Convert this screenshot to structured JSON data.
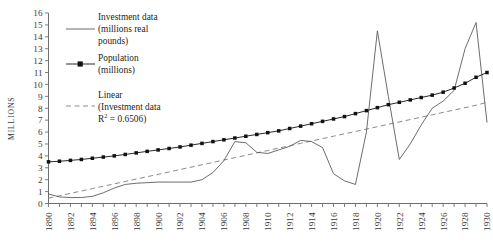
{
  "chart_data": {
    "type": "line",
    "title": "",
    "xlabel": "",
    "ylabel": "MILLIONS",
    "xlim": [
      1890,
      1930
    ],
    "ylim": [
      0,
      16
    ],
    "grid": false,
    "legend_position": "top-left-inside",
    "x_tick_labels": [
      "1890",
      "1892",
      "1894",
      "1896",
      "1898",
      "1900",
      "1902",
      "1904",
      "1906",
      "1908",
      "1910",
      "1912",
      "1914",
      "1916",
      "1918",
      "1920",
      "1922",
      "1924",
      "1926",
      "1928",
      "1930"
    ],
    "y_tick_labels": [
      "0",
      "1",
      "2",
      "3",
      "4",
      "5",
      "6",
      "7",
      "8",
      "9",
      "10",
      "11",
      "12",
      "13",
      "14",
      "15",
      "16"
    ],
    "x": [
      1890,
      1891,
      1892,
      1893,
      1894,
      1895,
      1896,
      1897,
      1898,
      1899,
      1900,
      1901,
      1902,
      1903,
      1904,
      1905,
      1906,
      1907,
      1908,
      1909,
      1910,
      1911,
      1912,
      1913,
      1914,
      1915,
      1916,
      1917,
      1918,
      1919,
      1920,
      1921,
      1922,
      1923,
      1924,
      1925,
      1926,
      1927,
      1928,
      1929,
      1930
    ],
    "series": [
      {
        "name": "Investment data (millions real pounds)",
        "style": "solid",
        "marker": "none",
        "color": "#555555",
        "values": [
          0.8,
          0.55,
          0.5,
          0.5,
          0.6,
          0.9,
          1.3,
          1.6,
          1.7,
          1.75,
          1.8,
          1.8,
          1.8,
          1.8,
          2.0,
          2.6,
          3.6,
          5.2,
          5.1,
          4.3,
          4.2,
          4.5,
          4.8,
          5.3,
          5.2,
          4.7,
          2.5,
          1.9,
          1.6,
          6.0,
          14.5,
          9.0,
          3.7,
          5.0,
          6.6,
          8.0,
          8.6,
          9.5,
          13.0,
          15.2,
          6.8
        ]
      },
      {
        "name": "Population (millions)",
        "style": "solid",
        "marker": "square",
        "color": "#000000",
        "values": [
          3.5,
          3.55,
          3.62,
          3.7,
          3.8,
          3.9,
          4.0,
          4.12,
          4.25,
          4.38,
          4.5,
          4.62,
          4.75,
          4.9,
          5.05,
          5.2,
          5.35,
          5.5,
          5.65,
          5.8,
          5.95,
          6.1,
          6.3,
          6.5,
          6.7,
          6.9,
          7.1,
          7.3,
          7.55,
          7.8,
          8.05,
          8.3,
          8.5,
          8.7,
          8.9,
          9.1,
          9.35,
          9.7,
          10.1,
          10.6,
          11.0
        ]
      },
      {
        "name": "Linear (Investment data)",
        "style": "dashed",
        "marker": "none",
        "color": "#777777",
        "trendline": true,
        "r_squared": 0.6506,
        "values": [
          0.45,
          0.65,
          0.85,
          1.05,
          1.25,
          1.45,
          1.65,
          1.85,
          2.05,
          2.25,
          2.45,
          2.65,
          2.85,
          3.05,
          3.25,
          3.45,
          3.65,
          3.85,
          4.05,
          4.25,
          4.45,
          4.65,
          4.85,
          5.05,
          5.25,
          5.45,
          5.65,
          5.85,
          6.05,
          6.25,
          6.45,
          6.65,
          6.85,
          7.05,
          7.25,
          7.45,
          7.65,
          7.85,
          8.05,
          8.25,
          8.5
        ]
      }
    ]
  },
  "legend": {
    "items": [
      {
        "id": "investment",
        "line1": "Investment data",
        "line2": "(millions real",
        "line3": "pounds)",
        "swatch": "solid-line"
      },
      {
        "id": "population",
        "line1": "Population",
        "line2": "(millions)",
        "line3": "",
        "swatch": "line-with-square-marker"
      },
      {
        "id": "trend",
        "line1": "Linear",
        "line2": "(Investment data",
        "line3_pre": "R",
        "line3_sup": "2",
        "line3_post": " = 0.6506)",
        "swatch": "dashed-line"
      }
    ]
  }
}
